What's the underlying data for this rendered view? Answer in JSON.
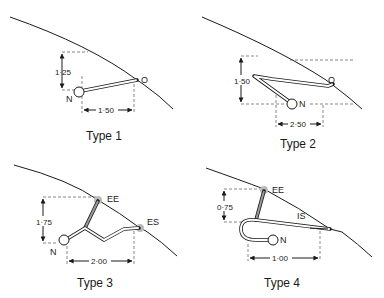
{
  "figure": {
    "panels": [
      {
        "title": "Type 1",
        "node_labels": [
          "N",
          "O"
        ],
        "dimensions": {
          "vertical": "1·25",
          "horizontal": "1·50"
        }
      },
      {
        "title": "Type 2",
        "node_labels": [
          "N",
          "O"
        ],
        "dimensions": {
          "vertical": "1·50",
          "horizontal": "2·50"
        }
      },
      {
        "title": "Type 3",
        "node_labels": [
          "N",
          "EE",
          "ES"
        ],
        "dimensions": {
          "vertical": "1·75",
          "horizontal": "2·00"
        }
      },
      {
        "title": "Type 4",
        "node_labels": [
          "N",
          "EE",
          "IS"
        ],
        "dimensions": {
          "vertical": "0·75",
          "horizontal": "1·00"
        }
      }
    ]
  }
}
